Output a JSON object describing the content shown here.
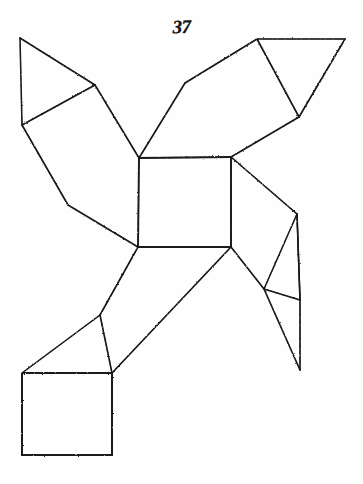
{
  "plate": {
    "figure_number": "37",
    "caption": "",
    "background_color": "#fefefe",
    "ink_color": "#1a1a1a",
    "width": 363,
    "height": 484
  },
  "drawing": {
    "title": "Polyhedron net diagram",
    "description": "Hand-drawn pinwheel net of squares and triangles around a central square",
    "stroke_color": "#1a1a1a",
    "stroke_width": 1.7,
    "vertices": {
      "c_tl": [
        139,
        158
      ],
      "c_tr": [
        231,
        157
      ],
      "c_br": [
        231,
        247
      ],
      "c_bl": [
        138,
        247
      ],
      "ul_sq_top": [
        95,
        85
      ],
      "ul_sq_left": [
        22,
        125
      ],
      "ul_sq_bot": [
        68,
        205
      ],
      "ul_tri_apex": [
        20,
        38
      ],
      "ur_sq_left": [
        185,
        83
      ],
      "ur_sq_top": [
        257,
        39
      ],
      "ur_sq_right": [
        299,
        117
      ],
      "ur_tri_right": [
        345,
        39
      ],
      "lr_sq_right": [
        275,
        290
      ],
      "lr_sq_bot": [
        264,
        286
      ],
      "lr_tri_corner": [
        297,
        214
      ],
      "lr_tri_bot": [
        300,
        370
      ],
      "ll_sq_left": [
        100,
        315
      ],
      "ll_sq_bot": [
        112,
        373
      ],
      "ll_tri_left": [
        22,
        373
      ],
      "bot_sq_tl": [
        22,
        373
      ],
      "bot_sq_tr": [
        112,
        373
      ],
      "bot_sq_br": [
        112,
        455
      ],
      "bot_sq_bl": [
        22,
        455
      ]
    },
    "faces": [
      {
        "name": "central-square",
        "type": "square",
        "points": "139,158 231,157 231,247 138,247"
      },
      {
        "name": "upper-left-square",
        "type": "square",
        "points": "139,158 95,85 22,125 68,205"
      },
      {
        "name": "upper-left-triangle",
        "type": "triangle",
        "points": "95,85 20,38 22,125"
      },
      {
        "name": "upper-right-square",
        "type": "square",
        "points": "231,157 185,83 257,39 299,117"
      },
      {
        "name": "upper-right-triangle",
        "type": "triangle",
        "points": "257,39 345,39 299,117"
      },
      {
        "name": "lower-right-square",
        "type": "square",
        "points": "231,247 297,214 300,300 264,289"
      },
      {
        "name": "lower-right-triangle",
        "type": "triangle",
        "points": "297,214 300,300 264,289"
      },
      {
        "name": "lower-left-square",
        "type": "square",
        "points": "138,247 100,315 112,373 231,247"
      },
      {
        "name": "lower-left-triangle",
        "type": "triangle",
        "points": "100,315 22,373 112,373"
      },
      {
        "name": "bottom-square",
        "type": "square",
        "points": "22,373 112,373 112,455 22,455"
      }
    ],
    "edges": [
      {
        "name": "central-sq-top",
        "d": "M 139,158 L 231,157",
        "w": 1.9
      },
      {
        "name": "central-sq-right",
        "d": "M 231,157 L 231,247",
        "w": 1.9
      },
      {
        "name": "central-sq-bottom",
        "d": "M 231,247 L 138,247",
        "w": 1.9
      },
      {
        "name": "central-sq-left",
        "d": "M 138,247 L 139,158",
        "w": 1.9
      },
      {
        "name": "ul-sq-edge-a",
        "d": "M 139,158 L 95,85",
        "w": 1.6
      },
      {
        "name": "ul-sq-edge-b",
        "d": "M 95,85 L 22,125",
        "w": 1.6
      },
      {
        "name": "ul-sq-edge-c",
        "d": "M 22,125 L 68,205",
        "w": 1.6
      },
      {
        "name": "ul-sq-edge-d",
        "d": "M 68,205 L 138,247",
        "w": 1.6
      },
      {
        "name": "ul-tri-edge-a",
        "d": "M 95,85 L 20,38",
        "w": 1.5
      },
      {
        "name": "ul-tri-edge-b",
        "d": "M 20,38 L 22,125",
        "w": 1.5
      },
      {
        "name": "ur-sq-edge-a",
        "d": "M 139,158 L 185,83",
        "w": 1.6
      },
      {
        "name": "ur-sq-edge-b",
        "d": "M 185,83 L 257,39",
        "w": 1.6
      },
      {
        "name": "ur-sq-edge-c",
        "d": "M 257,39 L 299,117",
        "w": 1.6
      },
      {
        "name": "ur-sq-edge-d",
        "d": "M 299,117 L 231,157",
        "w": 1.6
      },
      {
        "name": "ur-tri-edge-a",
        "d": "M 257,39 L 345,39",
        "w": 1.6
      },
      {
        "name": "ur-tri-edge-b",
        "d": "M 345,39 L 299,117",
        "w": 1.6
      },
      {
        "name": "lr-sq-edge-a",
        "d": "M 231,157 L 297,214",
        "w": 1.6
      },
      {
        "name": "lr-sq-edge-b",
        "d": "M 297,214 L 300,300",
        "w": 1.6
      },
      {
        "name": "lr-sq-edge-c",
        "d": "M 300,300 L 264,289",
        "w": 1.6
      },
      {
        "name": "lr-sq-edge-d",
        "d": "M 264,289 L 231,247",
        "w": 1.6
      },
      {
        "name": "lr-tri-edge-a",
        "d": "M 297,214 L 264,289",
        "w": 1.5
      },
      {
        "name": "lr-tri-edge-b",
        "d": "M 264,289 L 300,370",
        "w": 1.6
      },
      {
        "name": "lr-tri-edge-c",
        "d": "M 300,370 L 300,300",
        "w": 1.6
      },
      {
        "name": "lr-tri-edge-d",
        "d": "M 297,214 L 300,300",
        "w": 1.4
      },
      {
        "name": "ll-sq-edge-a",
        "d": "M 138,247 L 100,315",
        "w": 1.6
      },
      {
        "name": "ll-sq-edge-b",
        "d": "M 100,315 L 112,373",
        "w": 1.6
      },
      {
        "name": "ll-sq-edge-c",
        "d": "M 112,373 L 231,247",
        "w": 1.6
      },
      {
        "name": "ll-tri-edge-a",
        "d": "M 100,315 L 22,373",
        "w": 1.5
      },
      {
        "name": "bot-sq-top",
        "d": "M 22,373 L 112,373",
        "w": 2.0
      },
      {
        "name": "bot-sq-right",
        "d": "M 112,373 L 112,455",
        "w": 2.0
      },
      {
        "name": "bot-sq-bottom",
        "d": "M 112,455 L 22,455",
        "w": 2.0
      },
      {
        "name": "bot-sq-left",
        "d": "M 22,455 L 22,373",
        "w": 2.0
      }
    ]
  }
}
